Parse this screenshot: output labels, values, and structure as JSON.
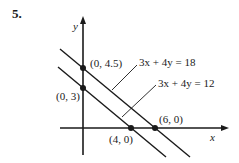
{
  "problem_number": "5.",
  "axes": {
    "x_label": "x",
    "y_label": "y"
  },
  "lines": [
    {
      "equation": "3x + 4y = 18",
      "x_intercept": "(6, 0)",
      "y_intercept": "(0, 4.5)"
    },
    {
      "equation": "3x + 4y = 12",
      "x_intercept": "(4, 0)",
      "y_intercept": "(0, 3)"
    }
  ],
  "points": {
    "p1": "(0, 4.5)",
    "p2": "(0, 3)",
    "p3": "(4, 0)",
    "p4": "(6, 0)"
  },
  "colors": {
    "ink": "#1a1a1a",
    "background": "#ffffff"
  }
}
